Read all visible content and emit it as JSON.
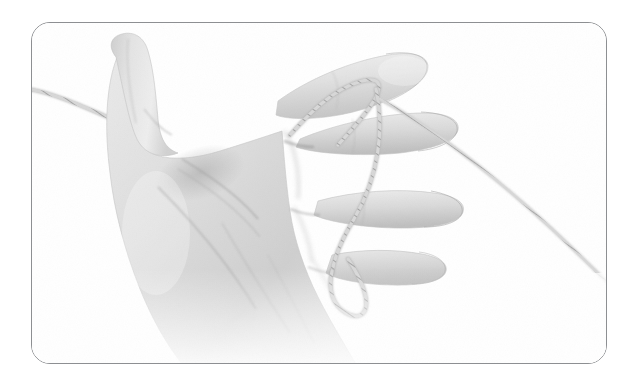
{
  "image": {
    "kind": "instructional-photograph",
    "subject": "left-hand-with-string-loops",
    "description": "Grayscale photograph of an open left hand, palm toward the viewer, thumb pointing up, with a thin twisted cord looped around the index finger and the ring finger; the cord enters from the left edge and runs off toward the lower right.",
    "palette": {
      "background": "#ffffff",
      "frame_border": "#8d8f92",
      "skin_light": "#f2f2f2",
      "skin_mid": "#dcdcdc",
      "skin_shadow": "#bdbdbd",
      "skin_deep_shadow": "#a8a8a8",
      "crease_line": "#9a9a9a",
      "cord_light": "#e8e8e8",
      "cord_mid": "#c9c9c9",
      "cord_dark": "#9c9c9c"
    },
    "frame": {
      "x": 31,
      "y": 22,
      "width": 576,
      "height": 342,
      "border_radius": 19,
      "border_width": 1
    },
    "cord": {
      "label": "twisted-string",
      "segments": [
        {
          "name": "entry-from-left-edge-to-thumb",
          "from": [
            32,
            90
          ],
          "to": [
            120,
            124
          ]
        },
        {
          "name": "loop-around-index-finger",
          "around": "index-finger",
          "at": [
            368,
            72
          ]
        },
        {
          "name": "index-loop-tail-down-to-ring-finger",
          "from": [
            368,
            80
          ],
          "to": [
            350,
            250
          ]
        },
        {
          "name": "loop-around-ring-finger",
          "around": "ring-finger",
          "at": [
            356,
            255
          ]
        },
        {
          "name": "free-run-to-lower-right",
          "from": [
            440,
            145
          ],
          "to": [
            606,
            300
          ]
        }
      ]
    },
    "hand": {
      "side": "left",
      "orientation": "palm-up-thumb-raised",
      "fingers": [
        {
          "name": "thumb",
          "tip": [
            102,
            37
          ],
          "has_cord_loop": false
        },
        {
          "name": "index",
          "tip": [
            424,
            57
          ],
          "has_cord_loop": true
        },
        {
          "name": "middle",
          "tip": [
            452,
            126
          ],
          "has_cord_loop": false
        },
        {
          "name": "ring",
          "tip": [
            462,
            212
          ],
          "has_cord_loop": true
        },
        {
          "name": "little",
          "tip": [
            444,
            272
          ],
          "has_cord_loop": false
        }
      ]
    }
  },
  "a11y": {
    "figure_alt": "Open left hand, palm facing the camera with the thumb pointing upward. A thin light-coloured twisted string comes in from the left, passes over the base of the thumb, loops once around the index finger, runs down across the palm side of the fingers, loops once around the ring finger, and the free end trails off toward the lower-right corner of the frame."
  }
}
